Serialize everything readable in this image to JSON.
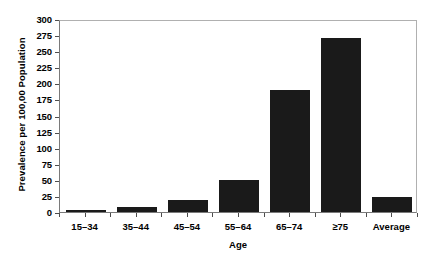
{
  "chart_data": {
    "type": "bar",
    "title": "",
    "subtitle": "",
    "xlabel": "Age",
    "ylabel": "Prevalence per 100,00 Population",
    "categories": [
      "15–34",
      "35–44",
      "45–54",
      "55–64",
      "65–74",
      "≥75",
      "Average"
    ],
    "values": [
      3,
      8,
      19,
      50,
      190,
      270,
      23
    ],
    "ylim": [
      0,
      300
    ],
    "yticks": [
      0,
      25,
      50,
      75,
      100,
      125,
      150,
      175,
      200,
      225,
      250,
      275,
      300
    ],
    "ytick_labels": [
      "0",
      "25",
      "50",
      "75",
      "100",
      "125",
      "150",
      "175",
      "200",
      "225",
      "250",
      "275",
      "300"
    ],
    "grid": false,
    "legend": null,
    "legend_position": "none",
    "annotations": [],
    "colors": {
      "bar": "#1a1a1a",
      "axis": "#7a7a7a",
      "frame": "#b0b0b0",
      "text": "#000000",
      "background": "#ffffff"
    }
  }
}
